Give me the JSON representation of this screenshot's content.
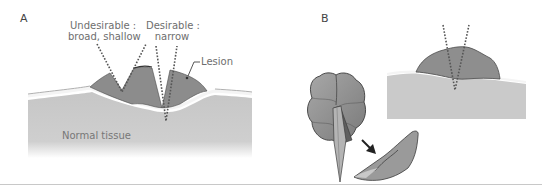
{
  "figure": {
    "panels": [
      {
        "id": "A",
        "letter": "A",
        "labels": {
          "undesirable_title": "Undesirable :",
          "undesirable_desc": "broad, shallow",
          "desirable_title": "Desirable :",
          "desirable_desc": "narrow",
          "lesion": "Lesion",
          "normal_tissue": "Normal tissue"
        }
      },
      {
        "id": "B",
        "letter": "B"
      }
    ],
    "colors": {
      "lesion_fill": "#8a8a8a",
      "lesion_outline": "#3a3a3a",
      "tissue_fill": "#c9c9c9",
      "membrane": "#f2f2f2",
      "text": "#6e6e6e",
      "divider": "#c8c8c8"
    }
  }
}
